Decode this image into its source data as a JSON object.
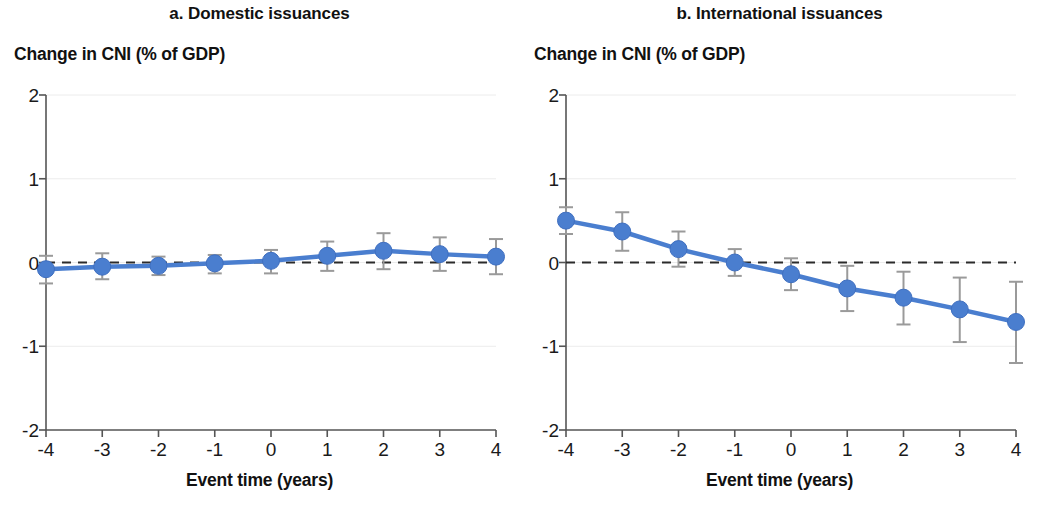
{
  "figure": {
    "xlabel": "Event time (years)",
    "ylabel": "Change in CNI (% of GDP)",
    "accent_color": "#4a7ecf",
    "errorbar_color": "#9a9a9a",
    "zeroline_color": "#2b2b2b",
    "axis_color": "#555555"
  },
  "panel_a": {
    "title": "a. Domestic issuances"
  },
  "panel_b": {
    "title": "b. International issuances"
  },
  "chart_data": [
    {
      "type": "line",
      "panel": "a",
      "title": "a. Domestic issuances",
      "xlabel": "Event time (years)",
      "ylabel": "Change in CNI (% of GDP)",
      "xlim": [
        -4,
        4
      ],
      "ylim": [
        -2,
        2
      ],
      "xticks": [
        -4,
        -3,
        -2,
        -1,
        0,
        1,
        2,
        3,
        4
      ],
      "xtick_labels": [
        "-4",
        "-3",
        "-2",
        "-1",
        "0",
        "1",
        "2",
        "3",
        "4"
      ],
      "yticks": [
        -2,
        -1,
        0,
        1,
        2
      ],
      "ytick_labels": [
        "-2",
        "-1",
        "0",
        "1",
        "2"
      ],
      "grid": false,
      "zero_reference_line": 0,
      "legend": null,
      "x": [
        -4,
        -3,
        -2,
        -1,
        0,
        1,
        2,
        3,
        4
      ],
      "values": [
        -0.08,
        -0.05,
        -0.04,
        -0.01,
        0.02,
        0.08,
        0.14,
        0.1,
        0.07
      ],
      "error_low": [
        -0.25,
        -0.2,
        -0.15,
        -0.13,
        -0.13,
        -0.1,
        -0.08,
        -0.1,
        -0.14
      ],
      "error_high": [
        0.08,
        0.11,
        0.07,
        0.09,
        0.15,
        0.25,
        0.35,
        0.3,
        0.28
      ]
    },
    {
      "type": "line",
      "panel": "b",
      "title": "b. International issuances",
      "xlabel": "Event time (years)",
      "ylabel": "Change in CNI (% of GDP)",
      "xlim": [
        -4,
        4
      ],
      "ylim": [
        -2,
        2
      ],
      "xticks": [
        -4,
        -3,
        -2,
        -1,
        0,
        1,
        2,
        3,
        4
      ],
      "xtick_labels": [
        "-4",
        "-3",
        "-2",
        "-1",
        "0",
        "1",
        "2",
        "3",
        "4"
      ],
      "yticks": [
        -2,
        -1,
        0,
        1,
        2
      ],
      "ytick_labels": [
        "-2",
        "-1",
        "0",
        "1",
        "2"
      ],
      "grid": false,
      "zero_reference_line": 0,
      "legend": null,
      "x": [
        -4,
        -3,
        -2,
        -1,
        0,
        1,
        2,
        3,
        4
      ],
      "values": [
        0.5,
        0.37,
        0.16,
        0.0,
        -0.14,
        -0.31,
        -0.42,
        -0.56,
        -0.71
      ],
      "error_low": [
        0.34,
        0.14,
        -0.05,
        -0.16,
        -0.33,
        -0.58,
        -0.74,
        -0.95,
        -1.2
      ],
      "error_high": [
        0.66,
        0.6,
        0.37,
        0.16,
        0.05,
        -0.04,
        -0.11,
        -0.18,
        -0.23
      ]
    }
  ]
}
